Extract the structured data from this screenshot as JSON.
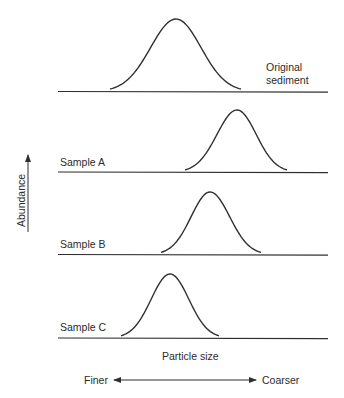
{
  "figure": {
    "line_color": "#2f2f2f",
    "background": "#ffffff"
  },
  "axes": {
    "y_label": "Abundance",
    "x_label": "Particle size",
    "x_direction": {
      "left_label": "Finer",
      "right_label": "Coarser"
    }
  },
  "panels": [
    {
      "id": "original",
      "label_line1": "Original",
      "label_line2": "sediment",
      "baseline_y": 91.5,
      "baseline_x_start": 58,
      "baseline_x_end": 328,
      "curve_start_x": 110,
      "curve_end_x": 241,
      "peak_x": 176,
      "peak_y": 19
    },
    {
      "id": "sample-a",
      "label": "Sample A",
      "baseline_y": 172,
      "baseline_x_start": 58,
      "baseline_x_end": 328,
      "curve_start_x": 185,
      "curve_end_x": 287,
      "peak_x": 237,
      "peak_y": 110
    },
    {
      "id": "sample-b",
      "label": "Sample B",
      "baseline_y": 254.5,
      "baseline_x_start": 58,
      "baseline_x_end": 328,
      "curve_start_x": 161,
      "curve_end_x": 261,
      "peak_x": 210,
      "peak_y": 192
    },
    {
      "id": "sample-c",
      "label": "Sample C",
      "baseline_y": 338,
      "baseline_x_start": 58,
      "baseline_x_end": 328,
      "curve_start_x": 121,
      "curve_end_x": 219,
      "peak_x": 170,
      "peak_y": 274
    }
  ]
}
